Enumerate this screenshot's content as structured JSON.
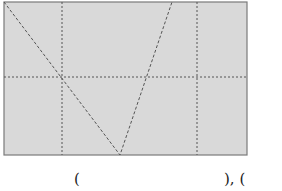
{
  "diagram": {
    "grid_background": "#d9d9d9",
    "border_color": "#7a7a7a",
    "line_color": "#555555",
    "rect": {
      "x1": 4,
      "y1": 2,
      "x2": 247,
      "y2": 155
    },
    "vertical_dashed_x": [
      62,
      197
    ],
    "horizontal_dashed_y": [
      77
    ],
    "polyline": [
      [
        4,
        2
      ],
      [
        120,
        155
      ],
      [
        172,
        2
      ]
    ]
  },
  "labels": {
    "left_paren": "(",
    "right_part": "), ("
  }
}
